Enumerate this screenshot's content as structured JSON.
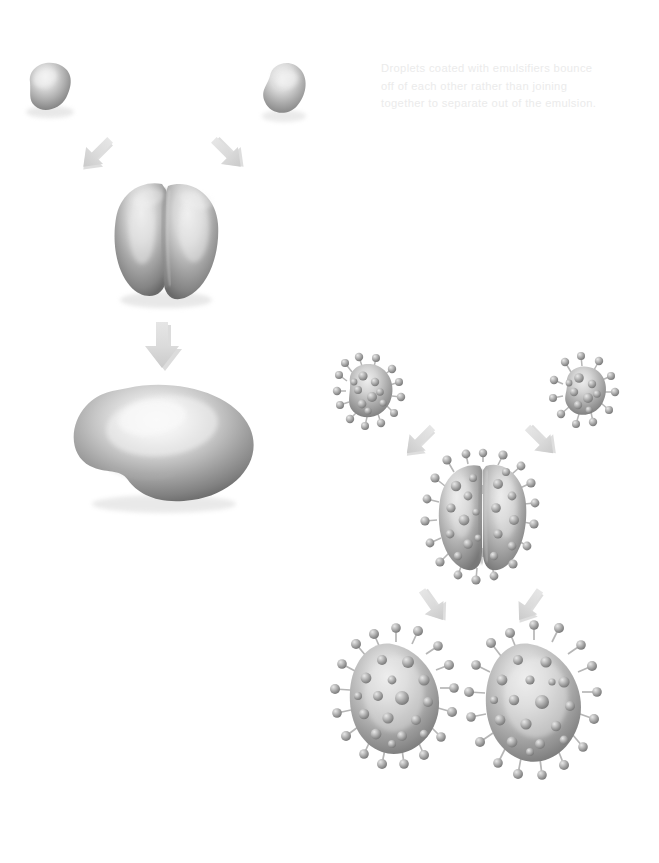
{
  "figure": {
    "background_color": "#ffffff",
    "caption_color": "#ebebeb",
    "droplet_fill_light": "#e4e4e4",
    "droplet_fill_mid": "#a8a8a8",
    "droplet_fill_dark": "#6e6e6e",
    "arrow_fill": "#d8d8d8",
    "arrow_shadow": "#b4b4b4",
    "emulsifier_fill": "#b0b0b0"
  },
  "caption": {
    "text": "Droplets coated with emulsifiers bounce\noff of each other rather than joining\ntogether to separate out of the emulsion.",
    "line1": "Droplets coated with emulsifiers bounce",
    "line2": "off of each other rather than joining",
    "line3": "together to separate out of the emulsion."
  },
  "left_panel": {
    "name": "uncoated-droplet-coalescence-sequence",
    "description": "Two bare oil droplets collide, merge into a two-lobed body, then relax into one large droplet.",
    "steps": [
      {
        "id": "droplet-top-left",
        "label": "bare droplet",
        "coated": false
      },
      {
        "id": "droplet-top-right",
        "label": "bare droplet",
        "coated": false
      },
      {
        "id": "droplet-pair-merging",
        "label": "droplets touching and merging",
        "coated": false
      },
      {
        "id": "droplet-coalesced",
        "label": "single coalesced droplet",
        "coated": false
      }
    ],
    "arrows": [
      {
        "id": "arrow-left-inward",
        "direction": "down-right"
      },
      {
        "id": "arrow-right-inward",
        "direction": "down-left"
      },
      {
        "id": "arrow-down-merge",
        "direction": "down"
      }
    ]
  },
  "right_panel": {
    "name": "emulsifier-coated-droplet-bounce-sequence",
    "description": "Two emulsifier-coated droplets approach, press together without merging, then bounce apart as two separate droplets.",
    "steps": [
      {
        "id": "coated-droplet-top-left",
        "label": "emulsifier coated droplet",
        "coated": true
      },
      {
        "id": "coated-droplet-top-right",
        "label": "emulsifier coated droplet",
        "coated": true
      },
      {
        "id": "coated-droplet-pair",
        "label": "coated droplets in contact",
        "coated": true
      },
      {
        "id": "coated-droplet-bottom-left",
        "label": "coated droplet bouncing away",
        "coated": true
      },
      {
        "id": "coated-droplet-bottom-right",
        "label": "coated droplet bouncing away",
        "coated": true
      }
    ],
    "arrows": [
      {
        "id": "arrow-coated-left-inward",
        "direction": "down-right"
      },
      {
        "id": "arrow-coated-right-inward",
        "direction": "down-left"
      },
      {
        "id": "arrow-coated-left-outward",
        "direction": "down-left"
      },
      {
        "id": "arrow-coated-right-outward",
        "direction": "down-right"
      }
    ]
  }
}
